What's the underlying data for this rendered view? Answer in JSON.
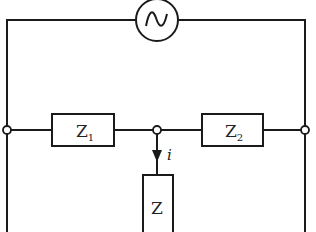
{
  "diagram": {
    "type": "circuit",
    "source": {
      "symbol": "~",
      "kind": "ac-voltage-source"
    },
    "components": [
      {
        "id": "Z1",
        "label": "Z",
        "subscript": "1"
      },
      {
        "id": "Z2",
        "label": "Z",
        "subscript": "2"
      },
      {
        "id": "Z",
        "label": "Z",
        "subscript": ""
      }
    ],
    "current": {
      "label": "i",
      "direction": "down",
      "through": "Z"
    },
    "colors": {
      "line": "#1a1a1a",
      "background": "#ffffff"
    }
  }
}
